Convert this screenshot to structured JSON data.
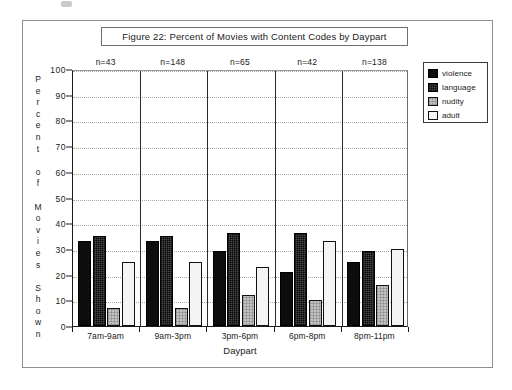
{
  "figure": {
    "title": "Figure 22:   Percent of Movies with Content Codes by Daypart",
    "y_axis_title_chars": [
      "P",
      "e",
      "r",
      "c",
      "e",
      "n",
      "t",
      "",
      "o",
      "f",
      "",
      "M",
      "o",
      "v",
      "i",
      "e",
      "s",
      "",
      "S",
      "h",
      "o",
      "w",
      "n"
    ]
  },
  "legend": {
    "items": [
      {
        "key": "violence",
        "label": "violence",
        "color": "#0d0d0d"
      },
      {
        "key": "language",
        "label": "language",
        "color": "#4a4a4a"
      },
      {
        "key": "nudity",
        "label": "nudity",
        "color": "#c2c2c2"
      },
      {
        "key": "adult",
        "label": "adult",
        "color": "#f4f4f4"
      }
    ]
  },
  "chart_data": {
    "type": "bar",
    "title": "Figure 22:   Percent of Movies with Content Codes by Daypart",
    "xlabel": "Daypart",
    "ylabel": "Percent of Movies Shown",
    "categories": [
      "7am-9am",
      "9am-3pm",
      "3pm-6pm",
      "6pm-8pm",
      "8pm-11pm"
    ],
    "group_annotations": [
      "n=43",
      "n=148",
      "n=65",
      "n=42",
      "n=138"
    ],
    "series": [
      {
        "name": "violence",
        "values": [
          33,
          33,
          29,
          21,
          25
        ]
      },
      {
        "name": "language",
        "values": [
          35,
          35,
          36,
          36,
          29
        ]
      },
      {
        "name": "nudity",
        "values": [
          7,
          7,
          12,
          10,
          16
        ]
      },
      {
        "name": "adult",
        "values": [
          25,
          25,
          23,
          33,
          30
        ]
      }
    ],
    "ylim": [
      0,
      100
    ],
    "ytick_labels": [
      "0",
      "10",
      "20",
      "30",
      "40",
      "50",
      "60",
      "70",
      "80",
      "90",
      "100"
    ],
    "ytick_values": [
      0,
      10,
      20,
      30,
      40,
      50,
      60,
      70,
      80,
      90,
      100
    ],
    "grid": true,
    "legend_position": "right-outside"
  }
}
